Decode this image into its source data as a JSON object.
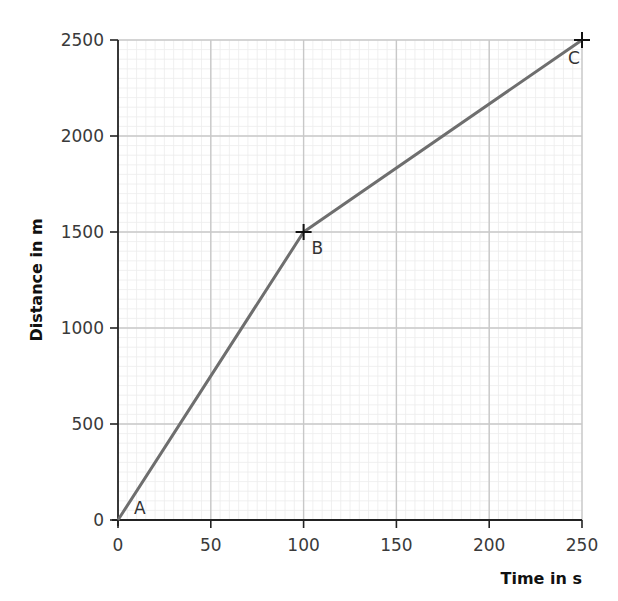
{
  "chart_data": {
    "type": "line",
    "title": "",
    "xlabel": "Time in s",
    "ylabel": "Distance in m",
    "xlim": [
      0,
      250
    ],
    "ylim": [
      0,
      2500
    ],
    "x_ticks": [
      0,
      50,
      100,
      150,
      200,
      250
    ],
    "y_ticks": [
      0,
      500,
      1000,
      1500,
      2000,
      2500
    ],
    "grid": {
      "major": true,
      "minor": true,
      "minor_divisions": 10
    },
    "legend": null,
    "series": [
      {
        "name": "distance-time",
        "x": [
          0,
          100,
          250
        ],
        "y": [
          0,
          1500,
          2500
        ],
        "color": "#6e6e6e"
      }
    ],
    "points": [
      {
        "label": "A",
        "x": 0,
        "y": 0
      },
      {
        "label": "B",
        "x": 100,
        "y": 1500
      },
      {
        "label": "C",
        "x": 250,
        "y": 2500
      }
    ]
  },
  "labels": {
    "xlabel": "Time in s",
    "ylabel": "Distance in m"
  },
  "colors": {
    "axis": "#222222",
    "major_grid": "#c8c8c8",
    "minor_grid": "#ececec",
    "line": "#6e6e6e",
    "marker": "#111111"
  }
}
